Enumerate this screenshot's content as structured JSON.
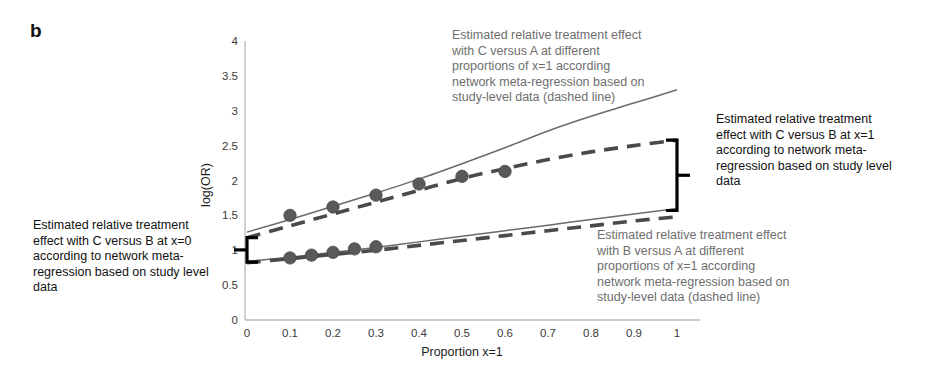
{
  "panel": {
    "label": "b"
  },
  "chart_data": {
    "type": "line",
    "title": "",
    "xlabel": "Proportion x=1",
    "ylabel": "log(OR)",
    "xlim": [
      0,
      1
    ],
    "ylim": [
      0,
      4
    ],
    "xticks": [
      "0",
      "0.1",
      "0.2",
      "0.3",
      "0.4",
      "0.5",
      "0.6",
      "0.7",
      "0.8",
      "0.9",
      "1"
    ],
    "yticks": [
      "0",
      "0.5",
      "1",
      "1.5",
      "2",
      "2.5",
      "3",
      "3.5",
      "4"
    ],
    "grid": false,
    "legend": "none",
    "series": [
      {
        "name": "C versus A (network meta-regression, solid line)",
        "style": "solid",
        "color": "#6b6b6b",
        "x": [
          0,
          0.1,
          0.2,
          0.3,
          0.4,
          0.5,
          0.6,
          0.7,
          0.8,
          0.9,
          1
        ],
        "values": [
          1.26,
          1.44,
          1.63,
          1.82,
          2.02,
          2.24,
          2.47,
          2.71,
          2.92,
          3.11,
          3.3
        ]
      },
      {
        "name": "C versus A (study-level data, dashed line)",
        "style": "dashed",
        "color": "#4a4a4a",
        "x": [
          0,
          0.1,
          0.2,
          0.3,
          0.4,
          0.5,
          0.6,
          0.7,
          0.8,
          0.9,
          1
        ],
        "values": [
          1.18,
          1.35,
          1.52,
          1.69,
          1.86,
          2.03,
          2.17,
          2.3,
          2.41,
          2.5,
          2.58
        ]
      },
      {
        "name": "B versus A (network meta-regression, solid line)",
        "style": "solid",
        "color": "#6b6b6b",
        "x": [
          0,
          0.1,
          0.2,
          0.3,
          0.4,
          0.5,
          0.6,
          0.7,
          0.8,
          0.9,
          1
        ],
        "values": [
          0.84,
          0.9,
          0.97,
          1.04,
          1.12,
          1.2,
          1.28,
          1.36,
          1.44,
          1.52,
          1.6
        ]
      },
      {
        "name": "B versus A (study-level data, dashed line)",
        "style": "dashed",
        "color": "#4a4a4a",
        "x": [
          0,
          0.1,
          0.2,
          0.3,
          0.4,
          0.5,
          0.6,
          0.7,
          0.8,
          0.9,
          1
        ],
        "values": [
          0.82,
          0.88,
          0.94,
          1.0,
          1.07,
          1.14,
          1.21,
          1.28,
          1.35,
          1.42,
          1.48
        ]
      }
    ],
    "markers": {
      "color": "#595959",
      "upper_series": {
        "x": [
          0.1,
          0.2,
          0.3,
          0.4,
          0.5,
          0.6
        ],
        "values": [
          1.5,
          1.62,
          1.79,
          1.95,
          2.06,
          2.13
        ]
      },
      "lower_series": {
        "x": [
          0.1,
          0.15,
          0.2,
          0.25,
          0.3
        ],
        "values": [
          0.89,
          0.93,
          0.97,
          1.02,
          1.05
        ]
      }
    },
    "brackets": [
      {
        "name": "left-bracket",
        "x": 0,
        "from": 0.83,
        "to": 1.18,
        "side": "left"
      },
      {
        "name": "right-bracket",
        "x": 1,
        "from": 1.57,
        "to": 2.58,
        "side": "right"
      }
    ]
  },
  "annotations": {
    "top": "Estimated relative treatment effect\nwith C versus A at different\nproportions of x=1 according\nnetwork meta-regression based on\nstudy-level data (dashed line)",
    "bottom": "Estimated relative treatment effect\nwith B versus A at different\nproportions of x=1 according\nnetwork meta-regression based on\nstudy-level data (dashed line)",
    "left": "Estimated relative treatment\neffect with C versus B at x=0\naccording to network meta-\nregression based on study level\ndata",
    "right": "Estimated relative treatment\neffect with C versus B at x=1\naccording to network meta-\nregression based on study level\ndata"
  },
  "colors": {
    "axis": "#b9b9b9",
    "solid_line": "#6b6b6b",
    "dashed_line": "#4a4a4a",
    "marker": "#595959",
    "bracket": "#000000",
    "annotation_gray": "#6e6e6e",
    "annotation_dark": "#111111"
  }
}
